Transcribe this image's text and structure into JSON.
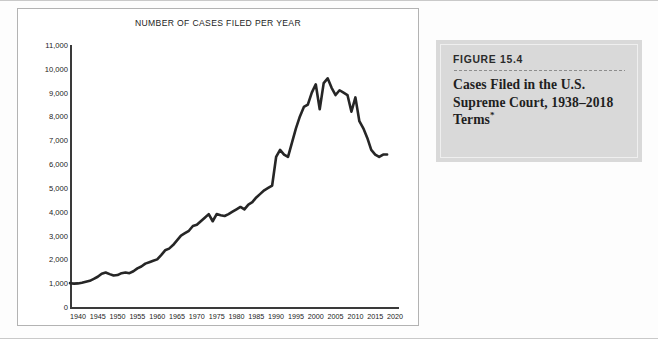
{
  "figure_card": {
    "number_label": "FIGURE 15.4",
    "caption": "Cases Filed in the U.S. Supreme Court, 1938–2018 Terms",
    "caption_footnote_marker": "*",
    "card_bg": "#d9d9d9",
    "inner_border": "#efefef"
  },
  "chart_data": {
    "type": "line",
    "title": "NUMBER OF CASES FILED PER YEAR",
    "xlabel": "",
    "ylabel": "",
    "xlim": [
      1938,
      2021
    ],
    "ylim": [
      0,
      11000
    ],
    "grid": false,
    "legend": null,
    "line_color": "#262626",
    "line_width": 2.6,
    "y_ticks": [
      0,
      1000,
      2000,
      3000,
      4000,
      5000,
      6000,
      7000,
      8000,
      9000,
      10000,
      11000
    ],
    "y_tick_labels": [
      "0",
      "1,000",
      "2,000",
      "3,000",
      "4,000",
      "5,000",
      "6,000",
      "7,000",
      "8,000",
      "9,000",
      "10,000",
      "11,000"
    ],
    "x_ticks": [
      1940,
      1945,
      1950,
      1955,
      1960,
      1965,
      1970,
      1975,
      1980,
      1985,
      1990,
      1995,
      2000,
      2005,
      2010,
      2015,
      2020
    ],
    "x_tick_labels": [
      "1940",
      "1945",
      "1950",
      "1955",
      "1960",
      "1965",
      "1970",
      "1975",
      "1980",
      "1985",
      "1990",
      "1995",
      "2000",
      "2005",
      "2010",
      "2015",
      "2020"
    ],
    "series": [
      {
        "name": "Cases filed per year",
        "x": [
          1938,
          1939,
          1940,
          1941,
          1942,
          1943,
          1944,
          1945,
          1946,
          1947,
          1948,
          1949,
          1950,
          1951,
          1952,
          1953,
          1954,
          1955,
          1956,
          1957,
          1958,
          1959,
          1960,
          1961,
          1962,
          1963,
          1964,
          1965,
          1966,
          1967,
          1968,
          1969,
          1970,
          1971,
          1972,
          1973,
          1974,
          1975,
          1976,
          1977,
          1978,
          1979,
          1980,
          1981,
          1982,
          1983,
          1984,
          1985,
          1986,
          1987,
          1988,
          1989,
          1990,
          1991,
          1992,
          1993,
          1994,
          1995,
          1996,
          1997,
          1998,
          1999,
          2000,
          2001,
          2002,
          2003,
          2004,
          2005,
          2006,
          2007,
          2008,
          2009,
          2010,
          2011,
          2012,
          2013,
          2014,
          2015,
          2016,
          2017,
          2018
        ],
        "values": [
          1000,
          980,
          990,
          1020,
          1060,
          1100,
          1180,
          1270,
          1400,
          1450,
          1380,
          1320,
          1340,
          1420,
          1450,
          1420,
          1500,
          1620,
          1700,
          1820,
          1880,
          1940,
          2000,
          2180,
          2380,
          2450,
          2600,
          2800,
          3000,
          3100,
          3200,
          3400,
          3450,
          3600,
          3750,
          3900,
          3600,
          3900,
          3850,
          3820,
          3900,
          4000,
          4100,
          4200,
          4100,
          4300,
          4400,
          4600,
          4750,
          4900,
          5000,
          5100,
          6300,
          6600,
          6400,
          6300,
          6900,
          7500,
          8000,
          8400,
          8500,
          9000,
          9350,
          8300,
          9400,
          9600,
          9200,
          8900,
          9100,
          9000,
          8900,
          8200,
          8800,
          7800,
          7500,
          7100,
          6600,
          6400,
          6300,
          6400,
          6400
        ]
      }
    ]
  }
}
